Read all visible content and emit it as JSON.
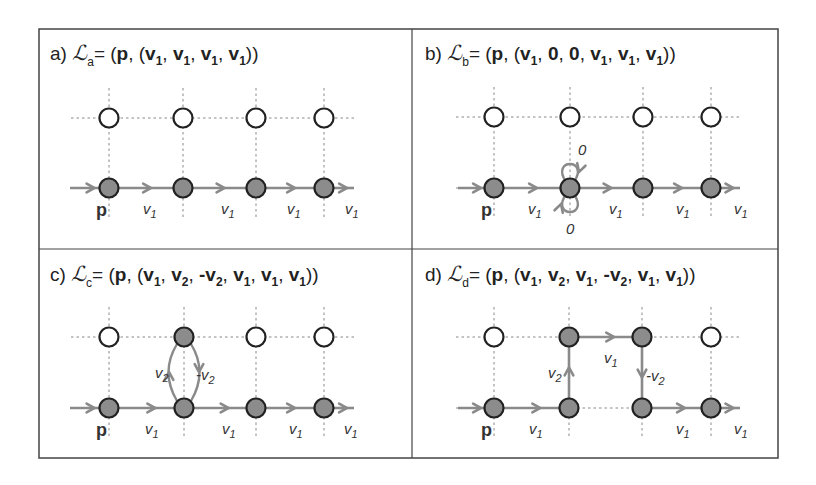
{
  "figure": {
    "frame": {
      "x": 39,
      "y": 29,
      "w": 739,
      "h": 429,
      "divider_x": 412,
      "divider_y": 249
    },
    "colors": {
      "frame": "#444444",
      "grid": "#888888",
      "path": "#8a8a8a",
      "node_filled": "#8c8c8c",
      "node_empty": "#ffffff",
      "node_stroke": "#222222",
      "text": "#222222"
    },
    "panels": [
      {
        "id": "a",
        "title": {
          "prefix": "a)",
          "symbol": "ℒ",
          "sub": "a",
          "tokens": [
            [
              "= (",
              ""
            ],
            [
              "p",
              "b"
            ],
            [
              ", (",
              ""
            ],
            [
              "v",
              "b1"
            ],
            [
              ", ",
              ""
            ],
            [
              "v",
              "b1"
            ],
            [
              ", ",
              ""
            ],
            [
              "v",
              "b1"
            ],
            [
              ", ",
              ""
            ],
            [
              "v",
              "b1"
            ],
            [
              "))",
              ""
            ]
          ]
        },
        "title_pos": {
          "x": 50,
          "y": 60
        },
        "cols": [
          109,
          183,
          256,
          324
        ],
        "rows": [
          118,
          188
        ],
        "filled": [
          [
            0,
            1
          ],
          [
            1,
            1
          ],
          [
            2,
            1
          ],
          [
            3,
            1
          ]
        ],
        "segments": [
          {
            "from": [
              70,
              188
            ],
            "to": [
              109,
              188
            ],
            "label": "",
            "arrow": 0.5
          },
          {
            "from": [
              109,
              188
            ],
            "to": [
              183,
              188
            ],
            "label": "v1",
            "arrow": 0.5,
            "lx": 143,
            "ly": 214
          },
          {
            "from": [
              183,
              188
            ],
            "to": [
              256,
              188
            ],
            "label": "v1",
            "arrow": 0.5,
            "lx": 221,
            "ly": 214
          },
          {
            "from": [
              256,
              188
            ],
            "to": [
              324,
              188
            ],
            "label": "v1",
            "arrow": 0.5,
            "lx": 287,
            "ly": 214
          },
          {
            "from": [
              324,
              188
            ],
            "to": [
              354,
              188
            ],
            "label": "v1",
            "arrow": 0.6,
            "lx": 345,
            "ly": 214
          }
        ],
        "p_label": {
          "text": "p",
          "x": 96,
          "y": 216
        }
      },
      {
        "id": "b",
        "title": {
          "prefix": "b)",
          "symbol": "ℒ",
          "sub": "b",
          "tokens": [
            [
              "= (",
              ""
            ],
            [
              "p",
              "b"
            ],
            [
              ", (",
              ""
            ],
            [
              "v",
              "b1"
            ],
            [
              ", ",
              ""
            ],
            [
              "0",
              "b"
            ],
            [
              ", ",
              ""
            ],
            [
              "0",
              "b"
            ],
            [
              ", ",
              ""
            ],
            [
              "v",
              "b1"
            ],
            [
              ", ",
              ""
            ],
            [
              "v",
              "b1"
            ],
            [
              ", ",
              ""
            ],
            [
              "v",
              "b1"
            ],
            [
              "))",
              ""
            ]
          ]
        },
        "title_pos": {
          "x": 425,
          "y": 60
        },
        "cols": [
          494,
          570,
          643,
          711
        ],
        "rows": [
          117,
          188
        ],
        "filled": [
          [
            0,
            1
          ],
          [
            1,
            1
          ],
          [
            2,
            1
          ],
          [
            3,
            1
          ]
        ],
        "segments": [
          {
            "from": [
              458,
              188
            ],
            "to": [
              494,
              188
            ],
            "label": "",
            "arrow": 0.5
          },
          {
            "from": [
              494,
              188
            ],
            "to": [
              570,
              188
            ],
            "label": "v1",
            "arrow": 0.5,
            "lx": 528,
            "ly": 214
          },
          {
            "from": [
              570,
              188
            ],
            "to": [
              643,
              188
            ],
            "label": "v1",
            "arrow": 0.5,
            "lx": 609,
            "ly": 214
          },
          {
            "from": [
              643,
              188
            ],
            "to": [
              711,
              188
            ],
            "label": "v1",
            "arrow": 0.5,
            "lx": 676,
            "ly": 214
          },
          {
            "from": [
              711,
              188
            ],
            "to": [
              740,
              188
            ],
            "label": "v1",
            "arrow": 0.6,
            "lx": 734,
            "ly": 214
          }
        ],
        "loops": [
          {
            "cx": 570,
            "cy": 188,
            "dir": "up",
            "label": "0",
            "lx": 578,
            "ly": 155
          },
          {
            "cx": 570,
            "cy": 188,
            "dir": "down",
            "label": "0",
            "lx": 566,
            "ly": 234
          }
        ],
        "p_label": {
          "text": "p",
          "x": 481,
          "y": 216
        }
      },
      {
        "id": "c",
        "title": {
          "prefix": "c)",
          "symbol": "ℒ",
          "sub": "c",
          "tokens": [
            [
              "= (",
              ""
            ],
            [
              "p",
              "b"
            ],
            [
              ", (",
              ""
            ],
            [
              "v",
              "b1"
            ],
            [
              ", ",
              ""
            ],
            [
              "v",
              "b2"
            ],
            [
              ", ",
              ""
            ],
            [
              "-v",
              "b2"
            ],
            [
              ", ",
              ""
            ],
            [
              "v",
              "b1"
            ],
            [
              ", ",
              ""
            ],
            [
              "v",
              "b1"
            ],
            [
              ", ",
              ""
            ],
            [
              "v",
              "b1"
            ],
            [
              "))",
              ""
            ]
          ]
        },
        "title_pos": {
          "x": 50,
          "y": 281
        },
        "cols": [
          109,
          184,
          256,
          324
        ],
        "rows": [
          337,
          408
        ],
        "filled": [
          [
            0,
            1
          ],
          [
            1,
            1
          ],
          [
            2,
            1
          ],
          [
            3,
            1
          ],
          [
            1,
            0
          ]
        ],
        "segments": [
          {
            "from": [
              70,
              408
            ],
            "to": [
              109,
              408
            ],
            "label": "",
            "arrow": 0.5
          },
          {
            "from": [
              109,
              408
            ],
            "to": [
              184,
              408
            ],
            "label": "v1",
            "arrow": 0.55,
            "lx": 145,
            "ly": 434
          },
          {
            "from": [
              184,
              408
            ],
            "to": [
              256,
              408
            ],
            "label": "v1",
            "arrow": 0.55,
            "lx": 222,
            "ly": 434
          },
          {
            "from": [
              256,
              408
            ],
            "to": [
              324,
              408
            ],
            "label": "v1",
            "arrow": 0.5,
            "lx": 289,
            "ly": 434
          },
          {
            "from": [
              324,
              408
            ],
            "to": [
              354,
              408
            ],
            "label": "v1",
            "arrow": 0.6,
            "lx": 344,
            "ly": 434
          }
        ],
        "arcs": [
          {
            "d": "M 177 401 Q 160 372 177 344",
            "label": "v2",
            "lx": 155,
            "ly": 378,
            "ax": 169,
            "ay": 372,
            "adir": "up"
          },
          {
            "d": "M 191 344 Q 208 372 191 401",
            "label": "-v2",
            "lx": 196,
            "ly": 380,
            "ax": 199,
            "ay": 372,
            "adir": "down"
          }
        ],
        "p_label": {
          "text": "p",
          "x": 96,
          "y": 436
        }
      },
      {
        "id": "d",
        "title": {
          "prefix": "d)",
          "symbol": "ℒ",
          "sub": "d",
          "tokens": [
            [
              "= (",
              ""
            ],
            [
              "p",
              "b"
            ],
            [
              ", (",
              ""
            ],
            [
              "v",
              "b1"
            ],
            [
              ", ",
              ""
            ],
            [
              "v",
              "b2"
            ],
            [
              ", ",
              ""
            ],
            [
              "v",
              "b1"
            ],
            [
              ", ",
              ""
            ],
            [
              "-v",
              "b2"
            ],
            [
              ", ",
              ""
            ],
            [
              "v",
              "b1"
            ],
            [
              ", ",
              ""
            ],
            [
              "v",
              "b1"
            ],
            [
              "))",
              ""
            ]
          ]
        },
        "title_pos": {
          "x": 425,
          "y": 281
        },
        "cols": [
          494,
          569,
          642,
          711
        ],
        "rows": [
          337,
          408
        ],
        "filled": [
          [
            0,
            1
          ],
          [
            1,
            1
          ],
          [
            2,
            1
          ],
          [
            3,
            1
          ],
          [
            1,
            0
          ],
          [
            2,
            0
          ]
        ],
        "segments": [
          {
            "from": [
              458,
              408
            ],
            "to": [
              494,
              408
            ],
            "label": "",
            "arrow": 0.5
          },
          {
            "from": [
              494,
              408
            ],
            "to": [
              569,
              408
            ],
            "label": "v1",
            "arrow": 0.55,
            "lx": 529,
            "ly": 434
          },
          {
            "from": [
              569,
              408
            ],
            "to": [
              569,
              337
            ],
            "label": "v2",
            "arrow": 0.5,
            "lx": 548,
            "ly": 378
          },
          {
            "from": [
              569,
              337
            ],
            "to": [
              642,
              337
            ],
            "label": "v1",
            "arrow": 0.55,
            "lx": 604,
            "ly": 363
          },
          {
            "from": [
              642,
              337
            ],
            "to": [
              642,
              408
            ],
            "label": "-v2",
            "arrow": 0.5,
            "lx": 646,
            "ly": 381
          },
          {
            "from": [
              642,
              408
            ],
            "to": [
              711,
              408
            ],
            "label": "v1",
            "arrow": 0.55,
            "lx": 676,
            "ly": 434
          },
          {
            "from": [
              711,
              408
            ],
            "to": [
              740,
              408
            ],
            "label": "v1",
            "arrow": 0.6,
            "lx": 734,
            "ly": 434
          }
        ],
        "p_label": {
          "text": "p",
          "x": 481,
          "y": 436
        }
      }
    ]
  }
}
